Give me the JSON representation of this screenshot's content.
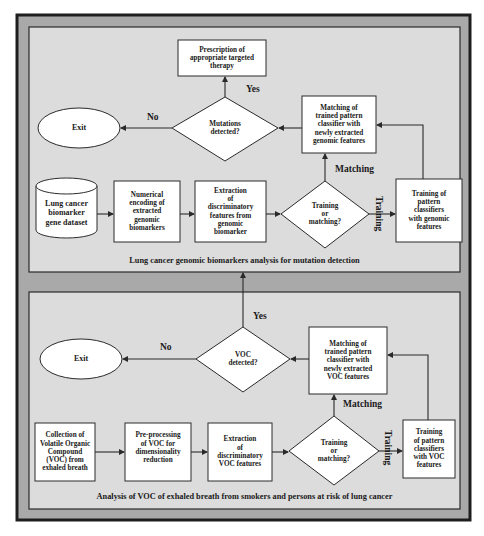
{
  "colors": {
    "outer_frame_fill": "#a9a9a9",
    "panel_fill": "#dcdcdc",
    "node_fill": "#ffffff",
    "stroke": "#2a2a2a"
  },
  "top_panel": {
    "caption": "Lung cancer genomic biomarkers analysis for mutation detection",
    "nodes": {
      "prescription": "Prescription of\nappropriate targeted\ntherapy",
      "mutations_decision": "Mutations\ndetected?",
      "exit": "Exit",
      "matching": "Matching of\ntrained pattern\nclassifier with\nnewly extracted\ngenomic features",
      "dataset": "Lung cancer\nbiomarker\ngene dataset",
      "encoding": "Numerical\nencoding of\nextracted\ngenomic\nbiomarkers",
      "extraction": "Extraction\nof\ndiscriminatory\nfeatures from\ngenomic\nbiomarker",
      "train_or_match": "Training\nor\nmatching?",
      "training": "Training of\npattern\nclassifiers\nwith genomic\nfeatures"
    },
    "edge_labels": {
      "yes": "Yes",
      "no": "No",
      "matching": "Matching",
      "training": "Training"
    }
  },
  "bottom_panel": {
    "caption": "Analysis of VOC of exhaled breath from smokers and persons at risk of lung cancer",
    "nodes": {
      "voc_decision": "VOC\ndetected?",
      "exit": "Exit",
      "matching": "Matching of\ntrained pattern\nclassifier with\nnewly extracted\nVOC features",
      "collection": "Collection of\nVolatile Organic\nCompound\n(VOC) from\nexhaled breath",
      "preprocessing": "Pre-processing\nof VOC for\ndimensionality\nreduction",
      "extraction": "Extraction\nof\ndiscriminatory\nVOC features",
      "train_or_match": "Training\nor\nmatching?",
      "training": "Training\nof pattern\nclassifiers\nwith VOC\nfeatures"
    },
    "edge_labels": {
      "yes": "Yes",
      "no": "No",
      "matching": "Matching",
      "training": "Training"
    }
  }
}
